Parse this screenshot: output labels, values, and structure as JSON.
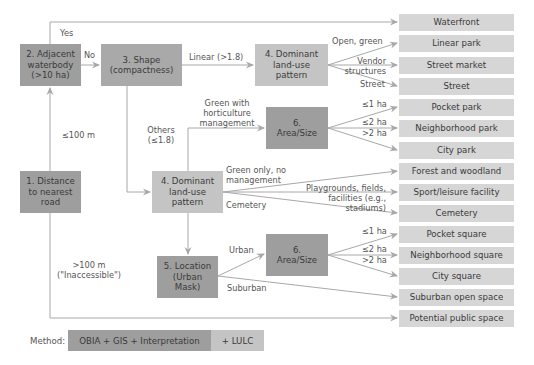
{
  "decision_nodes": {
    "adjacent_waterbody": "2. Adjacent waterbody (>10 ha)",
    "shape": "3. Shape (compactness)",
    "dominant_top": "4. Dominant land-use pattern",
    "area_size_top": "6. Area/Size",
    "distance_road": "1. Distance to nearest road",
    "dominant_mid": "4. Dominant land-use pattern",
    "location": "5. Location (Urban Mask)",
    "area_size_bottom": "6. Area/Size"
  },
  "node_lines": {
    "adjacent_waterbody": [
      "2. Adjacent",
      "waterbody",
      "(>10 ha)"
    ],
    "shape": [
      "3. Shape",
      "(compactness)"
    ],
    "dominant_top": [
      "4. Dominant",
      "land-use",
      "pattern"
    ],
    "area_size_top": [
      "6.",
      "Area/Size"
    ],
    "distance_road": [
      "1. Distance",
      "to nearest",
      "road"
    ],
    "dominant_mid": [
      "4. Dominant",
      "land-use",
      "pattern"
    ],
    "location": [
      "5. Location",
      "(Urban",
      "Mask)"
    ],
    "area_size_bottom": [
      "6.",
      "Area/Size"
    ]
  },
  "outcomes": [
    "Waterfront",
    "Linear park",
    "Street market",
    "Street",
    "Pocket park",
    "Neighborhood park",
    "City park",
    "Forest and woodland",
    "Sport/leisure facility",
    "Cemetery",
    "Pocket square",
    "Neighborhood square",
    "City square",
    "Suburban open space",
    "Potential public space"
  ],
  "edge_labels": {
    "yes": "Yes",
    "no": "No",
    "le100": "≤100 m",
    "gt100_1": ">100 m",
    "gt100_2": "(\"Inaccessible\")",
    "linear": "Linear (>1.8)",
    "others_1": "Others",
    "others_2": "(≤1.8)",
    "open_green": "Open, green",
    "vendor_1": "Vendor",
    "vendor_2": "structures",
    "street": "Street",
    "hort_1": "Green with",
    "hort_2": "horticulture",
    "hort_3": "management",
    "le1_top": "≤1 ha",
    "le2_top": "≤2 ha",
    "gt2_top": ">2 ha",
    "green_only_1": "Green only, no",
    "green_only_2": "management",
    "play_1": "Playgrounds, fields,",
    "play_2": "facilities (e.g.,",
    "play_3": "stadiums)",
    "cemetery": "Cemetery",
    "urban": "Urban",
    "suburban": "Suburban",
    "le1_bot": "≤1 ha",
    "le2_bot": "≤2 ha",
    "gt2_bot": ">2 ha"
  },
  "legend": {
    "label": "Method:",
    "primary": "OBIA + GIS + Interpretation",
    "secondary": "+ LULC"
  },
  "colors": {
    "dark_node": "#9e9e9e",
    "mid_node": "#a9a9a9",
    "light_node": "#c4c4c4",
    "outcome": "#d6d6d6",
    "line": "#a8a8a8"
  }
}
